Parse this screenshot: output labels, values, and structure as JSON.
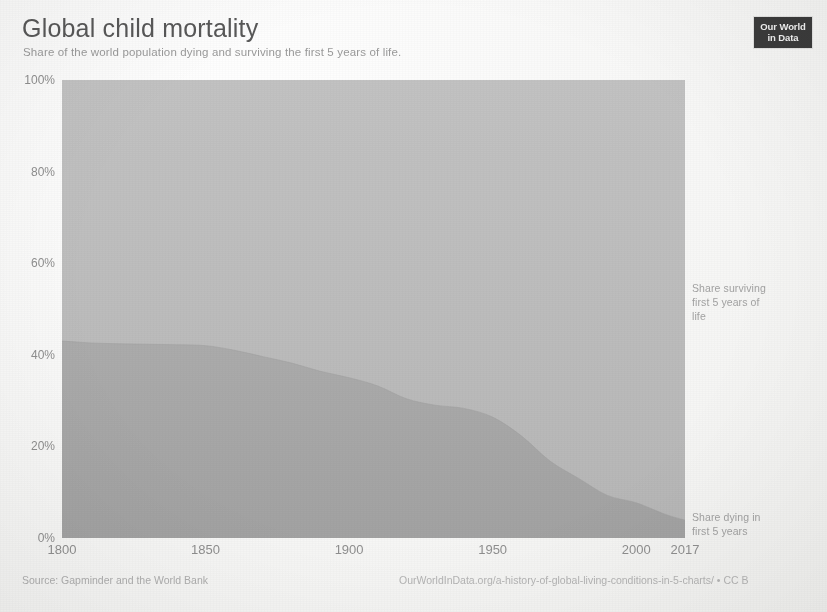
{
  "header": {
    "title": "Global child mortality",
    "subtitle": "Share of the world population dying and surviving the first 5 years of life.",
    "logo_line1": "Our World",
    "logo_line2": "in Data"
  },
  "annotations": {
    "surviving": "Share surviving\nfirst 5 years of\nlife",
    "dying": "Share dying in\nfirst 5 years"
  },
  "footer": {
    "source": "Source: Gapminder and the World Bank",
    "attribution": "OurWorldInData.org/a-history-of-global-living-conditions-in-5-charts/ • CC B"
  },
  "colors": {
    "background": "#fbfbfa",
    "dying_area": "#a9a9a9",
    "surviving_area": "#bcbcbc",
    "title_text": "#585858",
    "axis_text": "#8f8f8f",
    "logo_background": "#3b3b3b"
  },
  "chart_data": {
    "type": "area",
    "stacked": true,
    "title": "Global child mortality",
    "subtitle": "Share of the world population dying and surviving the first 5 years of life.",
    "xlabel": "",
    "ylabel": "",
    "xlim": [
      1800,
      2017
    ],
    "ylim": [
      0,
      100
    ],
    "grid": false,
    "legend_position": "inline-right",
    "xticks": [
      1800,
      1850,
      1900,
      1950,
      2000,
      2017
    ],
    "xtick_labels": [
      "1800",
      "1850",
      "1900",
      "1950",
      "2000",
      "2017"
    ],
    "yticks": [
      0,
      20,
      40,
      60,
      80,
      100
    ],
    "ytick_labels": [
      "0%",
      "20%",
      "40%",
      "60%",
      "80%",
      "100%"
    ],
    "x": [
      1800,
      1810,
      1820,
      1830,
      1840,
      1850,
      1860,
      1870,
      1880,
      1890,
      1900,
      1910,
      1920,
      1930,
      1940,
      1950,
      1960,
      1970,
      1980,
      1990,
      2000,
      2010,
      2017
    ],
    "series": [
      {
        "name": "Share dying in first 5 years",
        "color": "#a9a9a9",
        "values": [
          43.0,
          42.6,
          42.4,
          42.3,
          42.2,
          42.0,
          41.0,
          39.6,
          38.2,
          36.4,
          35.0,
          33.2,
          30.4,
          29.0,
          28.3,
          26.4,
          22.3,
          16.8,
          13.0,
          9.3,
          7.7,
          5.2,
          3.9
        ]
      },
      {
        "name": "Share surviving first 5 years of life",
        "color": "#bcbcbc",
        "values": [
          57.0,
          57.4,
          57.6,
          57.7,
          57.8,
          58.0,
          59.0,
          60.4,
          61.8,
          63.6,
          65.0,
          66.8,
          69.6,
          71.0,
          71.7,
          73.6,
          77.7,
          83.2,
          87.0,
          90.7,
          92.3,
          94.8,
          96.1
        ]
      }
    ]
  }
}
